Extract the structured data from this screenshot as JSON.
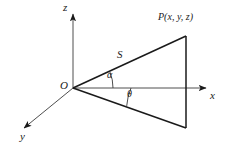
{
  "figure": {
    "type": "geometry-diagram",
    "background_color": "#ffffff",
    "stroke_color": "#1a1a1a",
    "axes": [
      {
        "id": "z",
        "label": "z",
        "direction": "up",
        "from": [
          73,
          88
        ],
        "to": [
          73,
          10
        ],
        "arrow": true
      },
      {
        "id": "x",
        "label": "x",
        "direction": "right",
        "from": [
          73,
          88
        ],
        "to": [
          210,
          88
        ],
        "arrow": true
      },
      {
        "id": "y",
        "label": "y",
        "direction": "down-left",
        "from": [
          73,
          88
        ],
        "to": [
          21,
          130
        ],
        "arrow": true
      }
    ],
    "origin": {
      "label": "O",
      "point": [
        73,
        88
      ]
    },
    "point": {
      "label": "P(x, y, z)",
      "point": [
        186,
        36
      ]
    },
    "segments": [
      {
        "id": "ray-upper",
        "label": "S",
        "from": [
          73,
          88
        ],
        "to": [
          186,
          36
        ]
      },
      {
        "id": "ray-lower",
        "label": "",
        "from": [
          73,
          88
        ],
        "to": [
          186,
          128
        ]
      },
      {
        "id": "vertical-edge",
        "label": "",
        "from": [
          186,
          36
        ],
        "to": [
          186,
          128
        ]
      }
    ],
    "angles": [
      {
        "id": "alpha",
        "label": "α",
        "between": [
          "ray-upper",
          "x-axis"
        ],
        "radius": 40
      },
      {
        "id": "theta",
        "label": "θ",
        "between": [
          "x-axis",
          "ray-lower"
        ],
        "radius": 58
      }
    ],
    "labels": {
      "z_axis": "z",
      "x_axis": "x",
      "y_axis": "y",
      "origin": "O",
      "hypotenuse": "S",
      "point": "P(x, y, z)",
      "angle_alpha": "α",
      "angle_theta": "θ"
    }
  }
}
